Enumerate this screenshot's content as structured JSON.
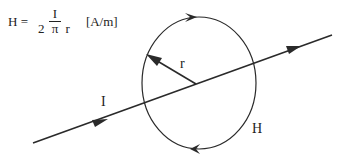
{
  "formula": {
    "lhs": "H =",
    "numerator": "I",
    "denominator": "2 π r",
    "unit": "[A/m]"
  },
  "labels": {
    "current": "I",
    "radius": "r",
    "field": "H"
  },
  "colors": {
    "stroke": "#2a2a2a",
    "background": "#ffffff"
  },
  "icons": {
    "current_direction": "arrow-right-icon",
    "field_direction_top": "chevron-right-icon",
    "field_direction_bottom": "chevron-left-icon",
    "radius_pointer": "arrow-up-left-icon"
  }
}
